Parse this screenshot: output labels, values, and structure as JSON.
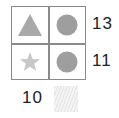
{
  "puzzle": {
    "grid": [
      [
        {
          "shape": "triangle",
          "color": "#a9a9a9"
        },
        {
          "shape": "circle",
          "color": "#9e9e9e"
        }
      ],
      [
        {
          "shape": "star",
          "color": "#c8c8c8"
        },
        {
          "shape": "circle",
          "color": "#9e9e9e"
        }
      ]
    ],
    "row_sums": [
      "13",
      "11"
    ],
    "column_sums": [
      "10",
      "?"
    ]
  },
  "colors": {
    "grid_line": "#8a8a8a",
    "text": "#222222"
  }
}
